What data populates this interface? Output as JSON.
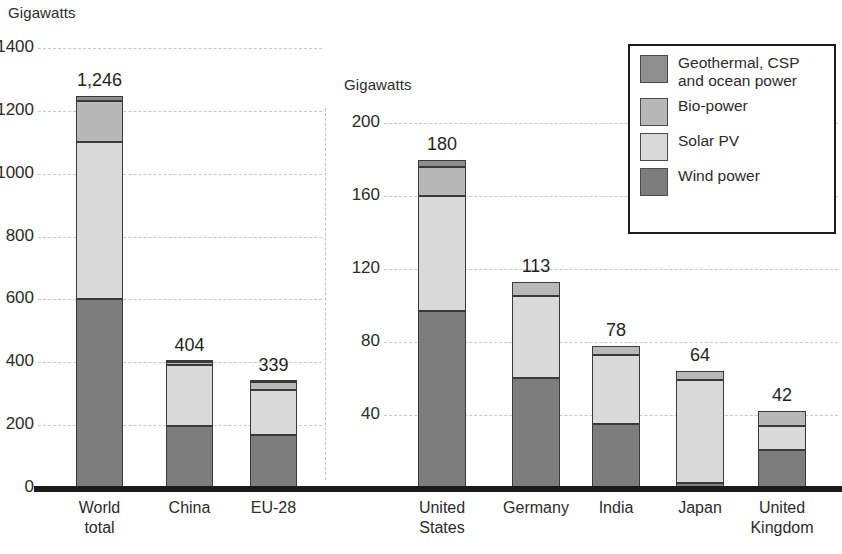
{
  "chart_data": {
    "type": "bar",
    "subtype": "stacked-bar",
    "title": "",
    "panels": [
      {
        "name": "left-panel",
        "ylabel": "Gigawatts",
        "ylim": [
          0,
          1400
        ],
        "yticks": [
          "0",
          "200",
          "400",
          "600",
          "800",
          "1000",
          "1200",
          "1400"
        ],
        "ytick_values": [
          0,
          200,
          400,
          600,
          800,
          1000,
          1200,
          1400
        ],
        "grid": true,
        "categories": [
          "World\ntotal",
          "China",
          "EU-28"
        ],
        "totals": [
          "1,246",
          "404",
          "339"
        ],
        "total_values": [
          1246,
          404,
          339
        ],
        "series": [
          {
            "name": "Wind power",
            "values": [
              602,
              198,
              170
            ]
          },
          {
            "name": "Solar PV",
            "values": [
              499,
              192,
              141
            ]
          },
          {
            "name": "Bio-power",
            "values": [
              129,
              12,
              26
            ]
          },
          {
            "name": "Geothermal, CSP and ocean power",
            "values": [
              16,
              2,
              2
            ]
          }
        ]
      },
      {
        "name": "right-panel",
        "ylabel": "Gigawatts",
        "ylim": [
          0,
          200
        ],
        "yticks": [
          "40",
          "80",
          "120",
          "160",
          "200"
        ],
        "ytick_values": [
          40,
          80,
          120,
          160,
          200
        ],
        "grid": true,
        "categories": [
          "United\nStates",
          "Germany",
          "India",
          "Japan",
          "United\nKingdom"
        ],
        "totals": [
          "180",
          "113",
          "78",
          "64",
          "42"
        ],
        "total_values": [
          180,
          113,
          78,
          64,
          42
        ],
        "series": [
          {
            "name": "Wind power",
            "values": [
              97,
              60,
              35,
              3,
              21
            ]
          },
          {
            "name": "Solar PV",
            "values": [
              63,
              45,
              38,
              56,
              13
            ]
          },
          {
            "name": "Bio-power",
            "values": [
              16,
              8,
              5,
              5,
              8
            ]
          },
          {
            "name": "Geothermal, CSP and ocean power",
            "values": [
              4,
              0,
              0,
              0,
              0
            ]
          }
        ]
      }
    ],
    "legend": {
      "position": "top-right",
      "entries": [
        {
          "label": "Geothermal, CSP\nand ocean power",
          "color": "#8e8e8e"
        },
        {
          "label": "Bio-power",
          "color": "#b8b8b8"
        },
        {
          "label": "Solar PV",
          "color": "#d9d9d9"
        },
        {
          "label": "Wind power",
          "color": "#7d7d7d"
        }
      ]
    },
    "colors": {
      "wind": "#7d7d7d",
      "solar": "#d9d9d9",
      "bio": "#b8b8b8",
      "geothermal": "#8e8e8e",
      "grid": "#c9c9c9",
      "axis": "#1a1a1a",
      "text": "#2b2b2b"
    }
  },
  "left": {
    "axis_title": "Gigawatts",
    "yticks": [
      "1400",
      "1200",
      "1000",
      "800",
      "600",
      "400",
      "200",
      "0"
    ],
    "bars": [
      {
        "label_line1": "World",
        "label_line2": "total",
        "value": "1,246"
      },
      {
        "label_line1": "China",
        "label_line2": "",
        "value": "404"
      },
      {
        "label_line1": "EU-28",
        "label_line2": "",
        "value": "339"
      }
    ]
  },
  "right": {
    "axis_title": "Gigawatts",
    "yticks": [
      "200",
      "160",
      "120",
      "80",
      "40"
    ],
    "bars": [
      {
        "label_line1": "United",
        "label_line2": "States",
        "value": "180"
      },
      {
        "label_line1": "Germany",
        "label_line2": "",
        "value": "113"
      },
      {
        "label_line1": "India",
        "label_line2": "",
        "value": "78"
      },
      {
        "label_line1": "Japan",
        "label_line2": "",
        "value": "64"
      },
      {
        "label_line1": "United",
        "label_line2": "Kingdom",
        "value": "42"
      }
    ]
  },
  "legend": {
    "items": [
      {
        "label": "Geothermal, CSP\nand ocean power"
      },
      {
        "label": "Bio-power"
      },
      {
        "label": "Solar PV"
      },
      {
        "label": "Wind power"
      }
    ]
  }
}
